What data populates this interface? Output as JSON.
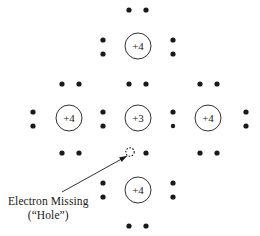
{
  "figure": {
    "name": "silicon-lattice-with-hole-diagram",
    "width": 260,
    "height": 236,
    "background_color": "#ffffff",
    "ink_color": "#1a1a1a"
  },
  "annotation": {
    "line1": "Electron Missing",
    "line2": "(“Hole”)",
    "x": 8,
    "y": 194,
    "arrow": {
      "from_x": 62,
      "from_y": 192,
      "to_x": 127,
      "to_y": 156
    }
  },
  "atoms": [
    {
      "label": "+4",
      "cx": 138,
      "cy": 46,
      "r": 13,
      "name": "atom-top"
    },
    {
      "label": "+4",
      "cx": 69,
      "cy": 118,
      "r": 13,
      "name": "atom-left"
    },
    {
      "label": "+3",
      "cx": 138,
      "cy": 118,
      "r": 13,
      "name": "atom-center-dopant"
    },
    {
      "label": "+4",
      "cx": 208,
      "cy": 118,
      "r": 13,
      "name": "atom-right"
    },
    {
      "label": "+4",
      "cx": 138,
      "cy": 190,
      "r": 13,
      "name": "atom-bottom"
    }
  ],
  "electrons": [
    {
      "cx": 129,
      "cy": 10,
      "r": 2.6
    },
    {
      "cx": 146,
      "cy": 10,
      "r": 2.6
    },
    {
      "cx": 103,
      "cy": 40,
      "r": 2.6
    },
    {
      "cx": 103,
      "cy": 54,
      "r": 2.6
    },
    {
      "cx": 173,
      "cy": 40,
      "r": 2.6
    },
    {
      "cx": 173,
      "cy": 54,
      "r": 2.6
    },
    {
      "cx": 62,
      "cy": 84,
      "r": 2.6
    },
    {
      "cx": 79,
      "cy": 84,
      "r": 2.6
    },
    {
      "cx": 129,
      "cy": 84,
      "r": 2.6
    },
    {
      "cx": 146,
      "cy": 84,
      "r": 2.6
    },
    {
      "cx": 200,
      "cy": 84,
      "r": 2.6
    },
    {
      "cx": 217,
      "cy": 84,
      "r": 2.6
    },
    {
      "cx": 33,
      "cy": 112,
      "r": 2.6
    },
    {
      "cx": 33,
      "cy": 126,
      "r": 2.6
    },
    {
      "cx": 103,
      "cy": 112,
      "r": 2.6
    },
    {
      "cx": 103,
      "cy": 126,
      "r": 2.6
    },
    {
      "cx": 173,
      "cy": 112,
      "r": 2.6
    },
    {
      "cx": 173,
      "cy": 126,
      "r": 2.2
    },
    {
      "cx": 246,
      "cy": 112,
      "r": 2.6
    },
    {
      "cx": 246,
      "cy": 126,
      "r": 2.6
    },
    {
      "cx": 62,
      "cy": 153,
      "r": 2.6
    },
    {
      "cx": 79,
      "cy": 153,
      "r": 2.6
    },
    {
      "cx": 146,
      "cy": 153,
      "r": 2.6
    },
    {
      "cx": 200,
      "cy": 153,
      "r": 2.6
    },
    {
      "cx": 217,
      "cy": 153,
      "r": 2.6
    },
    {
      "cx": 103,
      "cy": 183,
      "r": 2.6
    },
    {
      "cx": 103,
      "cy": 197,
      "r": 2.6
    },
    {
      "cx": 173,
      "cy": 183,
      "r": 2.6
    },
    {
      "cx": 173,
      "cy": 197,
      "r": 2.6
    },
    {
      "cx": 129,
      "cy": 226,
      "r": 2.6
    },
    {
      "cx": 146,
      "cy": 226,
      "r": 2.6
    }
  ],
  "hole": {
    "cx": 130,
    "cy": 152,
    "r": 4.2,
    "name": "electron-hole-marker"
  }
}
